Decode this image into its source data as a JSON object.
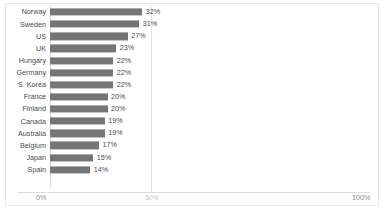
{
  "chart_data": {
    "type": "bar",
    "orientation": "horizontal",
    "title": "",
    "xlabel": "",
    "ylabel": "",
    "xlim": [
      0,
      100
    ],
    "grid": false,
    "legend": false,
    "value_suffix": "%",
    "categories": [
      "Norway",
      "Sweden",
      "US",
      "UK",
      "Hungary",
      "Germany",
      "S. Korea",
      "France",
      "Finland",
      "Canada",
      "Australia",
      "Belgium",
      "Japan",
      "Spain"
    ],
    "values": [
      32,
      31,
      27,
      23,
      22,
      22,
      22,
      20,
      20,
      19,
      19,
      17,
      15,
      14
    ],
    "value_labels": [
      "32%",
      "31%",
      "27%",
      "23%",
      "22%",
      "22%",
      "22%",
      "20%",
      "20%",
      "19%",
      "19%",
      "17%",
      "15%",
      "14%"
    ],
    "x_ticks": [
      {
        "value": 0,
        "label": "0%"
      },
      {
        "value": 50,
        "label": "50%"
      },
      {
        "value": 100,
        "label": "100%"
      }
    ],
    "bar_color": "#757575"
  }
}
